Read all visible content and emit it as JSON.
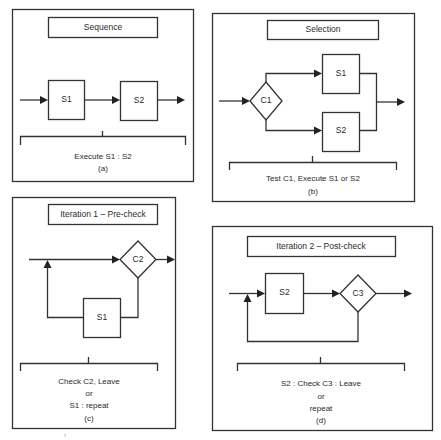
{
  "panels": {
    "a": {
      "title": "Sequence",
      "nodes": {
        "s1": "S1",
        "s2": "S2"
      },
      "caption": [
        "Execute S1 : S2",
        "(a)"
      ]
    },
    "b": {
      "title": "Selection",
      "nodes": {
        "c1": "C1",
        "s1": "S1",
        "s2": "S2"
      },
      "caption": [
        "Test C1, Execute S1 or S2",
        "(b)"
      ]
    },
    "c": {
      "title": "Iteration 1 – Pre-check",
      "nodes": {
        "c2": "C2",
        "s1": "S1"
      },
      "caption": [
        "Check C2, Leave",
        "or",
        "S1 : repeat",
        "(c)"
      ]
    },
    "d": {
      "title": "Iteration 2 – Post-check",
      "nodes": {
        "s2": "S2",
        "c3": "C3"
      },
      "caption": [
        "S2 : Check C3 : Leave",
        "or",
        "repeat",
        "(d)"
      ]
    }
  },
  "footnote_mark": "i"
}
